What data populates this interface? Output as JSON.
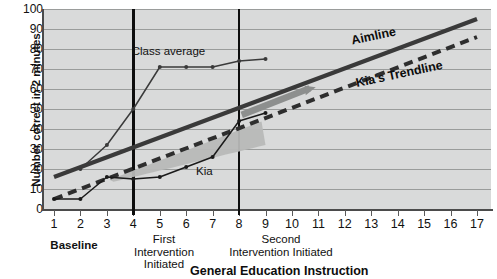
{
  "chart_data": {
    "type": "line",
    "title": "",
    "xlabel": "General Education Instruction",
    "ylabel": "Number correct in 2 minutes",
    "xlim": [
      0.45,
      17.6
    ],
    "ylim": [
      0,
      100
    ],
    "grid": true,
    "legend_position": "inline-annotations",
    "x_ticks": [
      "1",
      "2",
      "3",
      "4",
      "5",
      "6",
      "7",
      "8",
      "9",
      "10",
      "11",
      "12",
      "13",
      "14",
      "15",
      "16",
      "17"
    ],
    "y_ticks": [
      "0",
      "10",
      "20",
      "30",
      "40",
      "50",
      "60",
      "70",
      "80",
      "90",
      "100"
    ],
    "x": [
      1,
      2,
      3,
      4,
      5,
      6,
      7,
      8,
      9,
      10,
      11,
      12,
      13,
      14,
      15,
      16,
      17
    ],
    "series": [
      {
        "name": "Kia",
        "style": "thin-line-with-markers",
        "color": "#1a1a1a",
        "x": [
          1,
          2,
          3,
          4,
          5,
          6,
          7,
          8,
          9
        ],
        "values": [
          5,
          5,
          16,
          15,
          16,
          21,
          26,
          44,
          48
        ]
      },
      {
        "name": "Class average",
        "style": "thin-line-with-markers",
        "color": "#3a3a3a",
        "x": [
          2,
          3,
          4,
          5,
          6,
          7,
          8,
          9
        ],
        "values": [
          20,
          32,
          50,
          71,
          71,
          71,
          74,
          75
        ]
      },
      {
        "name": "Aimline",
        "style": "thick-solid",
        "color": "#3a3a3a",
        "x": [
          1,
          17
        ],
        "values": [
          16,
          95
        ]
      },
      {
        "name": "Kia's Trendline",
        "style": "thick-dashed",
        "color": "#2e2e2e",
        "x": [
          1,
          17
        ],
        "values": [
          5,
          86
        ]
      }
    ],
    "shaded_region": {
      "name": "gap-wedge",
      "color": "#b8b9b8",
      "from_x": 3.1,
      "to_x": 9.0,
      "description": "shaded wedge between trendline and Kia's data"
    },
    "phase_lines": [
      {
        "label": "First Intervention Initiated",
        "x": 4
      },
      {
        "label": "Second Intervention Initiated",
        "x": 8
      }
    ],
    "annotations": [
      {
        "text": "Class average",
        "x": 5.0,
        "y": 78
      },
      {
        "text": "Kia",
        "x": 6.6,
        "y": 18
      },
      {
        "text": "Aimline",
        "x": 13.2,
        "y": 84
      },
      {
        "text": "Kia's Trendline",
        "x": 14.2,
        "y": 66
      }
    ]
  },
  "axis": {
    "y_title": "Number correct in 2 minutes",
    "x_title": "General Education Instruction",
    "y_ticks": [
      "100",
      "90",
      "80",
      "70",
      "60",
      "50",
      "40",
      "30",
      "20",
      "10",
      "0"
    ],
    "x_ticks": [
      "1",
      "2",
      "3",
      "4",
      "5",
      "6",
      "7",
      "8",
      "9",
      "10",
      "11",
      "12",
      "13",
      "14",
      "15",
      "16",
      "17"
    ]
  },
  "labels": {
    "baseline": "Baseline",
    "first_intervention": "First\nIntervention\nInitiated",
    "second_intervention": "Second\nIntervention Initiated",
    "class_average": "Class average",
    "kia": "Kia",
    "aimline": "Aimline",
    "kia_trendline": "Kia's Trendline"
  },
  "colors": {
    "plot_background": "#d9dada",
    "gridline": "#9a9c9b",
    "axis": "#4b4b4b",
    "aimline": "#3a3a3a",
    "trendline": "#2e2e2e",
    "kia_line": "#1a1a1a",
    "class_line": "#3a3a3a",
    "shade": "#b8b9b8",
    "phase_line": "#0d0d0d",
    "text": "#111111"
  }
}
